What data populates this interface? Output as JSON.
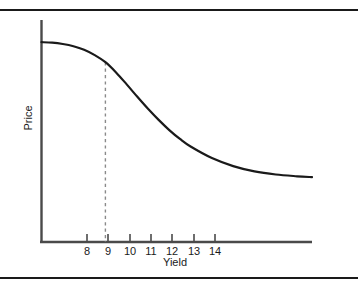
{
  "chart_data": {
    "type": "line",
    "title": "",
    "subtitle": "",
    "xlabel": "Yield",
    "ylabel": "Price",
    "grid": false,
    "legend": null,
    "legend_position": "none",
    "xlim": [
      7.0,
      19.7
    ],
    "ylim": [
      0,
      10
    ],
    "xticks": [
      "8",
      "9",
      "10",
      "11",
      "12",
      "13",
      "14"
    ],
    "xtick_values": [
      8,
      9,
      10,
      11,
      12,
      13,
      14
    ],
    "yticks": [],
    "series": [
      {
        "name": "Price",
        "x": [
          7.0,
          7.5,
          8.0,
          8.5,
          9.0,
          9.5,
          10.0,
          10.5,
          11.0,
          11.5,
          12.0,
          12.5,
          13.0,
          13.5,
          14.0,
          15.0,
          16.0,
          17.0,
          18.0,
          19.0,
          19.7
        ],
        "values": [
          9.0,
          8.98,
          8.92,
          8.82,
          8.66,
          8.42,
          8.1,
          7.64,
          7.1,
          6.54,
          6.0,
          5.5,
          5.04,
          4.64,
          4.3,
          3.78,
          3.42,
          3.18,
          3.04,
          2.96,
          2.92
        ]
      }
    ],
    "annotations": [
      {
        "name": "reference-line-yield-10",
        "type": "vertical-dashed-line",
        "x": 10,
        "y_from": 0,
        "y_to": 8.1,
        "label": ""
      }
    ],
    "colors": {
      "curve": "#1a1a1a",
      "axis": "#4a4a4a",
      "dashed_line": "#8a8a8a",
      "rule": "#1a1a1a",
      "background": "#ffffff",
      "text": "#1a1a1a"
    }
  },
  "axes": {
    "x_tick_labels": [
      {
        "text": "8",
        "left": 77
      },
      {
        "text": "9",
        "left": 98
      },
      {
        "text": "10",
        "left": 120
      },
      {
        "text": "11",
        "left": 141
      },
      {
        "text": "12",
        "left": 162
      },
      {
        "text": "13",
        "left": 184
      },
      {
        "text": "14",
        "left": 205
      }
    ],
    "x_axis_title": "Yield",
    "y_axis_title": "Price"
  }
}
